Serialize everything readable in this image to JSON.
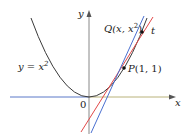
{
  "diagram": {
    "colors": {
      "curve": "#3a3a3a",
      "axis_left": "#5a78c8",
      "axis_right": "#b9b27a",
      "y_axis": "#888888",
      "secant": "#4a6fd0",
      "tangent": "#e24848",
      "points": "#111111"
    },
    "labels": {
      "y_axis": "y",
      "x_axis": "x",
      "origin": "0",
      "curve_lhs": "y = x",
      "curve_exp": "2",
      "point_q_prefix": "Q",
      "point_q_args": "(x, x",
      "point_q_exp": "2",
      "point_q_close": ")",
      "tangent_name": "t",
      "point_p": "P",
      "point_p_args": "(1, 1)"
    }
  }
}
